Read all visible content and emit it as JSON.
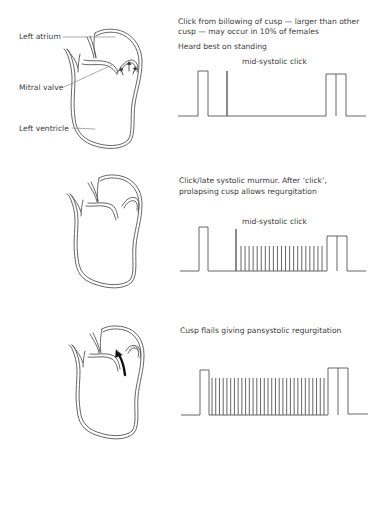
{
  "panels": [
    {
      "id": "normal-click",
      "labels": {
        "left_atrium": "Left atrium",
        "mitral_valve": "Mitral valve",
        "left_ventricle": "Left ventricle"
      },
      "description_line1": "Click from billowing of cusp — larger than other",
      "description_line2": "cusp — may occur in 10% of females",
      "note": "Heard best on standing",
      "waveform_label": "mid-systolic click"
    },
    {
      "id": "late-systolic-murmur",
      "description_line1": "Click/late systolic murmur. After ‘click’,",
      "description_line2": "prolapsing cusp allows regurgitation",
      "waveform_label": "mid-systolic click"
    },
    {
      "id": "pansystolic",
      "description_line1": "Cusp flails giving pansystolic regurgitation"
    }
  ],
  "colors": {
    "line": "#555555",
    "text": "#3a3a3a",
    "background": "#ffffff"
  }
}
